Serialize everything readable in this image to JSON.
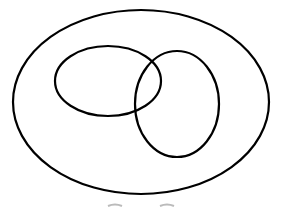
{
  "diagram": {
    "type": "venn",
    "stroke_color": "#000000",
    "background": "#ffffff",
    "shapes": [
      {
        "name": "universal-set",
        "cx": 141,
        "cy": 102,
        "rx": 128,
        "ry": 92
      },
      {
        "name": "set-a",
        "cx": 108,
        "cy": 81,
        "rx": 53,
        "ry": 35
      },
      {
        "name": "set-b",
        "cx": 177,
        "cy": 104,
        "rx": 42,
        "ry": 53
      }
    ]
  }
}
